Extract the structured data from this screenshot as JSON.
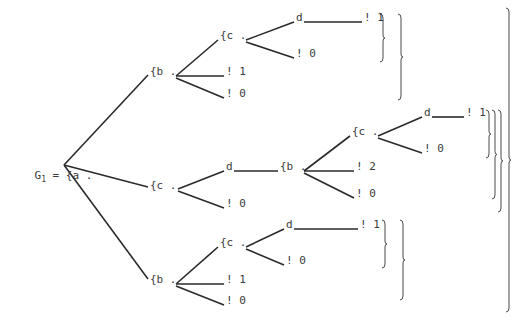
{
  "diagram": {
    "type": "tree",
    "root_label": {
      "prefix": "G",
      "subscript": "1",
      "suffix": " = {a ."
    },
    "nodes": [
      {
        "id": "b_top",
        "label": "{b .",
        "x": 150,
        "y": 73
      },
      {
        "id": "c_top",
        "label": "{c .",
        "x": 220,
        "y": 37
      },
      {
        "id": "d_top",
        "label": "d",
        "x": 296,
        "y": 19
      },
      {
        "id": "leaf_top_d1",
        "label": "! 1",
        "x": 364,
        "y": 19
      },
      {
        "id": "leaf_top_c0",
        "label": "! 0",
        "x": 296,
        "y": 55
      },
      {
        "id": "leaf_top_b1",
        "label": "! 1",
        "x": 226,
        "y": 73
      },
      {
        "id": "leaf_top_b0",
        "label": "! 0",
        "x": 226,
        "y": 95
      },
      {
        "id": "c_mid",
        "label": "{c .",
        "x": 150,
        "y": 187
      },
      {
        "id": "d_mid",
        "label": "d",
        "x": 226,
        "y": 168
      },
      {
        "id": "leaf_mid_c0",
        "label": "! 0",
        "x": 226,
        "y": 205
      },
      {
        "id": "b_mid",
        "label": "{b .",
        "x": 280,
        "y": 168
      },
      {
        "id": "c_mid2",
        "label": "{c .",
        "x": 352,
        "y": 133
      },
      {
        "id": "d_mid2",
        "label": "d",
        "x": 424,
        "y": 114
      },
      {
        "id": "leaf_mid_d1",
        "label": "! 1",
        "x": 466,
        "y": 114
      },
      {
        "id": "leaf_mid_c2_0",
        "label": "! 0",
        "x": 424,
        "y": 150
      },
      {
        "id": "leaf_mid_b2",
        "label": "! 2",
        "x": 356,
        "y": 168
      },
      {
        "id": "leaf_mid_b0",
        "label": "! 0",
        "x": 356,
        "y": 195
      },
      {
        "id": "b_bot",
        "label": "{b .",
        "x": 150,
        "y": 281
      },
      {
        "id": "c_bot",
        "label": "{c .",
        "x": 220,
        "y": 244
      },
      {
        "id": "d_bot",
        "label": "d",
        "x": 286,
        "y": 226
      },
      {
        "id": "leaf_bot_d1",
        "label": "! 1",
        "x": 360,
        "y": 226
      },
      {
        "id": "leaf_bot_c0",
        "label": "! 0",
        "x": 286,
        "y": 262
      },
      {
        "id": "leaf_bot_b1",
        "label": "! 1",
        "x": 226,
        "y": 281
      },
      {
        "id": "leaf_bot_b0",
        "label": "! 0",
        "x": 226,
        "y": 302
      }
    ],
    "edges": [
      [
        64,
        165,
        148,
        75
      ],
      [
        64,
        165,
        148,
        187
      ],
      [
        64,
        165,
        148,
        279
      ],
      [
        176,
        76,
        218,
        40
      ],
      [
        176,
        76,
        224,
        76
      ],
      [
        176,
        78,
        224,
        98
      ],
      [
        246,
        40,
        294,
        22
      ],
      [
        246,
        42,
        294,
        58
      ],
      [
        304,
        22,
        362,
        22
      ],
      [
        178,
        189,
        224,
        171
      ],
      [
        178,
        191,
        224,
        208
      ],
      [
        234,
        171,
        278,
        171
      ],
      [
        304,
        171,
        350,
        136
      ],
      [
        304,
        171,
        354,
        171
      ],
      [
        304,
        173,
        354,
        198
      ],
      [
        378,
        136,
        422,
        117
      ],
      [
        378,
        138,
        422,
        153
      ],
      [
        432,
        117,
        464,
        117
      ],
      [
        176,
        284,
        218,
        247
      ],
      [
        176,
        284,
        224,
        284
      ],
      [
        176,
        286,
        224,
        305
      ],
      [
        246,
        247,
        284,
        229
      ],
      [
        246,
        249,
        284,
        265
      ],
      [
        294,
        229,
        358,
        229
      ]
    ],
    "braces": [
      {
        "x": 382,
        "top": 14,
        "bottom": 62
      },
      {
        "x": 400,
        "top": 14,
        "bottom": 100
      },
      {
        "x": 488,
        "top": 110,
        "bottom": 158
      },
      {
        "x": 494,
        "top": 110,
        "bottom": 199
      },
      {
        "x": 500,
        "top": 110,
        "bottom": 212
      },
      {
        "x": 508,
        "top": 8,
        "bottom": 312
      },
      {
        "x": 384,
        "top": 220,
        "bottom": 268
      },
      {
        "x": 402,
        "top": 220,
        "bottom": 300
      }
    ]
  }
}
